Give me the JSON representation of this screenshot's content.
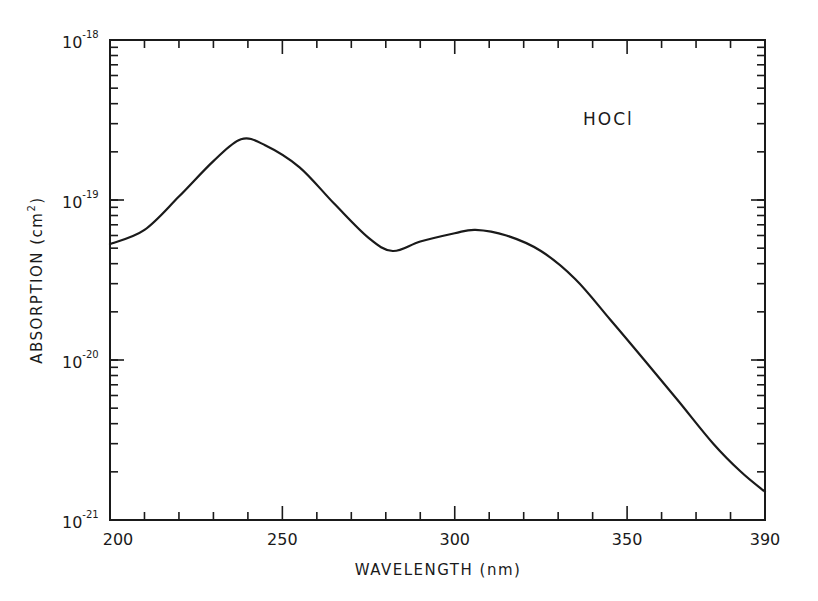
{
  "chart_data": {
    "type": "line",
    "title": "",
    "annotation": "HOCl",
    "xlabel": "WAVELENGTH (nm)",
    "ylabel": "ABSORPTION (cm²)",
    "xlim": [
      200,
      390
    ],
    "ylim": [
      1e-21,
      1e-18
    ],
    "yscale": "log",
    "grid": false,
    "x_ticks": [
      200,
      250,
      300,
      350,
      390
    ],
    "x_tick_labels": [
      "200",
      "250",
      "300",
      "350",
      "390"
    ],
    "y_ticks": [
      1e-21,
      1e-20,
      1e-19,
      1e-18
    ],
    "y_tick_labels": [
      {
        "base": "10",
        "exp": "-21"
      },
      {
        "base": "10",
        "exp": "-20"
      },
      {
        "base": "10",
        "exp": "-19"
      },
      {
        "base": "10",
        "exp": "-18"
      }
    ],
    "series": [
      {
        "name": "HOCl",
        "x": [
          200,
          210,
          220,
          230,
          238,
          245,
          255,
          265,
          275,
          282,
          290,
          300,
          306,
          315,
          325,
          335,
          345,
          355,
          365,
          375,
          383,
          390
        ],
        "values": [
          5.3e-20,
          6.5e-20,
          1.05e-19,
          1.75e-19,
          2.4e-19,
          2.2e-19,
          1.6e-19,
          9.5e-20,
          5.8e-20,
          4.8e-20,
          5.5e-20,
          6.2e-20,
          6.5e-20,
          6e-20,
          4.8e-20,
          3.2e-20,
          1.8e-20,
          1e-20,
          5.5e-21,
          3e-21,
          2e-21,
          1.5e-21
        ]
      }
    ]
  },
  "labels": {
    "annotation": "HOCl",
    "xlabel": "WAVELENGTH (nm)",
    "ylabel_main": "ABSORPTION (cm",
    "ylabel_sup": "2",
    "ylabel_close": ")"
  },
  "colors": {
    "line": "#1a1a1a",
    "background": "#ffffff"
  }
}
